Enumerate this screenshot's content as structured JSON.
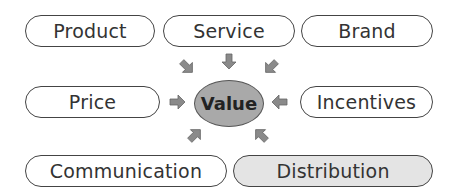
{
  "diagram": {
    "center": {
      "label": "Value",
      "fill": "#a9a9a9"
    },
    "nodes": [
      {
        "id": "product",
        "label": "Product"
      },
      {
        "id": "service",
        "label": "Service"
      },
      {
        "id": "brand",
        "label": "Brand"
      },
      {
        "id": "price",
        "label": "Price"
      },
      {
        "id": "incentives",
        "label": "Incentives"
      },
      {
        "id": "communication",
        "label": "Communication"
      },
      {
        "id": "distribution",
        "label": "Distribution",
        "fill": "#e4e4e4"
      }
    ],
    "arrow_color": "#8a8a8a",
    "edges": [
      {
        "from": "product",
        "to": "value"
      },
      {
        "from": "service",
        "to": "value"
      },
      {
        "from": "brand",
        "to": "value"
      },
      {
        "from": "price",
        "to": "value"
      },
      {
        "from": "incentives",
        "to": "value"
      },
      {
        "from": "communication",
        "to": "value"
      },
      {
        "from": "distribution",
        "to": "value"
      }
    ]
  }
}
